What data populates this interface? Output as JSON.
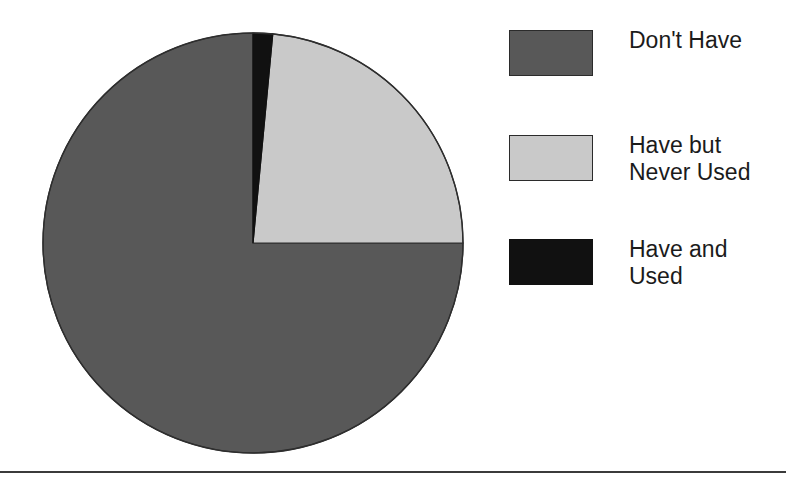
{
  "figure": {
    "background_color": "#ffffff",
    "rule_color": "#3b3b3b"
  },
  "chart_data": {
    "type": "pie",
    "title": "",
    "subtitle": "",
    "xlabel": "",
    "ylabel": "",
    "grid": false,
    "legend_position": "right",
    "start_angle_deg": 0,
    "direction": "clockwise",
    "center": {
      "x": 253,
      "y": 243
    },
    "radius": 210,
    "categories": [
      "Have and Used",
      "Have but Never Used",
      "Don't Have"
    ],
    "values": [
      1.5,
      23.5,
      75
    ],
    "units": "percent",
    "slices": [
      {
        "label": "Have and Used",
        "value": 1.5,
        "color": "#111111",
        "start_deg": 0,
        "end_deg": 5.4
      },
      {
        "label": "Have but Never Used",
        "value": 23.5,
        "color": "#c9c9c9",
        "start_deg": 5.4,
        "end_deg": 90
      },
      {
        "label": "Don't Have",
        "value": 75,
        "color": "#585858",
        "start_deg": 90,
        "end_deg": 360
      }
    ],
    "annotations": []
  },
  "legend": {
    "items": [
      {
        "label": "Don't Have",
        "swatch_name": "legend-swatch-dont-have",
        "color": "#585858"
      },
      {
        "label": "Have but\nNever Used",
        "swatch_name": "legend-swatch-have-but-never-used",
        "color": "#c9c9c9"
      },
      {
        "label": "Have and\nUsed",
        "swatch_name": "legend-swatch-have-and-used",
        "color": "#111111"
      }
    ]
  }
}
